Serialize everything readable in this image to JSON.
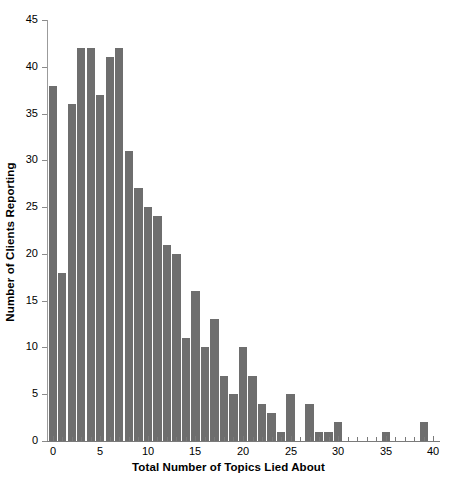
{
  "chart_data": {
    "type": "bar",
    "title": "",
    "subtitle": "",
    "xlabel": "Total Number of Topics Lied About",
    "ylabel": "Number of Clients Reporting",
    "categories": [
      0,
      1,
      2,
      3,
      4,
      5,
      6,
      7,
      8,
      9,
      10,
      11,
      12,
      13,
      14,
      15,
      16,
      17,
      18,
      19,
      20,
      21,
      22,
      23,
      24,
      25,
      26,
      27,
      28,
      29,
      30,
      31,
      32,
      33,
      34,
      35,
      36,
      37,
      38,
      39,
      40
    ],
    "values": [
      38,
      18,
      36,
      42,
      42,
      37,
      41,
      42,
      31,
      27,
      25,
      24,
      21,
      20,
      11,
      16,
      10,
      13,
      7,
      5,
      10,
      7,
      4,
      3,
      1,
      5,
      0,
      4,
      1,
      1,
      2,
      0,
      0,
      0,
      0,
      1,
      0,
      0,
      0,
      2,
      0
    ],
    "xlim": [
      -0.6,
      40.6
    ],
    "ylim": [
      0,
      45
    ],
    "xticks": [
      0,
      5,
      10,
      15,
      20,
      25,
      30,
      35,
      40
    ],
    "xtick_labels": [
      "0",
      "5",
      "10",
      "15",
      "20",
      "25",
      "30",
      "35",
      "40"
    ],
    "yticks": [
      0,
      5,
      10,
      15,
      20,
      25,
      30,
      35,
      40,
      45
    ],
    "ytick_labels": [
      "0",
      "5",
      "10",
      "15",
      "20",
      "25",
      "30",
      "35",
      "40",
      "45"
    ],
    "grid": false,
    "legend": null,
    "bar_color": "#6e6e6e",
    "axis_color": "#7a7a7a",
    "background": "#ffffff"
  }
}
